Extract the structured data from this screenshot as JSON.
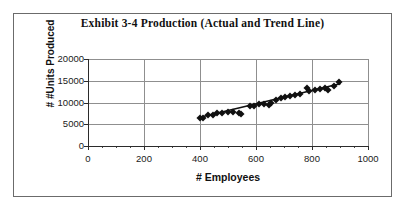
{
  "figure": {
    "title": "Exhibit 3-4  Production (Actual and Trend Line)",
    "frame_color": "#6b6b6b",
    "background": "#ffffff"
  },
  "chart_data": {
    "type": "scatter",
    "title": "Exhibit 3-4  Production (Actual and Trend Line)",
    "xlabel": "# Employees",
    "ylabel": "# #Units Produced",
    "xlim": [
      0,
      1000
    ],
    "ylim": [
      0,
      20000
    ],
    "xticks": [
      0,
      200,
      400,
      600,
      800,
      1000
    ],
    "yticks": [
      0,
      5000,
      10000,
      15000,
      20000
    ],
    "xtick_labels": [
      "0",
      "200",
      "400",
      "600",
      "800",
      "1000"
    ],
    "ytick_labels": [
      "0",
      "5000",
      "10000",
      "15000",
      "20000"
    ],
    "grid": "horizontal-and-vertical",
    "legend": "none",
    "marker_style": "filled-diamond",
    "marker_color": "#101010",
    "trendline_color": "#101010",
    "series": [
      {
        "name": "Actual Production",
        "type": "scatter",
        "x": [
          400,
          410,
          430,
          445,
          462,
          480,
          500,
          518,
          540,
          548,
          578,
          592,
          610,
          628,
          645,
          652,
          672,
          690,
          705,
          722,
          740,
          758,
          782,
          790,
          812,
          828,
          848,
          858,
          880,
          898
        ],
        "y": [
          6400,
          6550,
          7050,
          7150,
          7550,
          7700,
          7750,
          7850,
          7600,
          7450,
          9150,
          9300,
          9550,
          9700,
          9450,
          9900,
          10650,
          10950,
          11300,
          11450,
          11700,
          12050,
          13400,
          12750,
          12950,
          13100,
          13300,
          12950,
          13900,
          14700
        ]
      },
      {
        "name": "Trend Line",
        "type": "line",
        "x": [
          400,
          900
        ],
        "y": [
          6600,
          14300
        ]
      }
    ]
  },
  "axes": {
    "y_title": "# #Units Produced",
    "x_title": "# Employees"
  }
}
